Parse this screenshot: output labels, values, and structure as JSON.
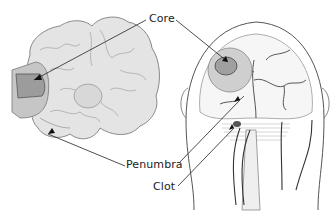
{
  "diagram": {
    "labels": {
      "core": "Core",
      "penumbra": "Penumbra",
      "clot": "Clot"
    },
    "panels": [
      {
        "name": "brain-coronal-section",
        "description": "Cross-section of brain showing infarct core and surrounding penumbra"
      },
      {
        "name": "head-front-view",
        "description": "Frontal view of head with cerebral arteries, core, penumbra and clot in artery"
      }
    ],
    "colors": {
      "core_fill": "#9a9a9a",
      "penumbra_fill": "#c4c4c4",
      "tissue_fill": "#e2e2e2",
      "line": "#333333"
    }
  }
}
